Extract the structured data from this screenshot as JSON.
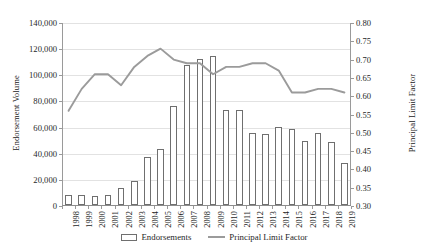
{
  "chart_data": {
    "type": "bar",
    "title": "",
    "subtitle": "",
    "xlabel": "",
    "ylabel": "Endorsement Volume",
    "y2label": "Principal Limit Factor",
    "grid": true,
    "legend_position": "bottom",
    "categories": [
      "1998",
      "1999",
      "2000",
      "2001",
      "2002",
      "2003",
      "2004",
      "2005",
      "2006",
      "2007",
      "2008",
      "2009",
      "2010",
      "2011",
      "2012",
      "2013",
      "2014",
      "2015",
      "2016",
      "2017",
      "2018",
      "2019"
    ],
    "ylim": [
      0,
      140000
    ],
    "ytick_labels": [
      "0",
      "20,000",
      "40,000",
      "60,000",
      "80,000",
      "100,000",
      "120,000",
      "140,000"
    ],
    "ytick_values": [
      0,
      20000,
      40000,
      60000,
      80000,
      100000,
      120000,
      140000
    ],
    "y2lim": [
      0.3,
      0.8
    ],
    "y2tick_labels": [
      "0.30",
      "0.35",
      "0.40",
      "0.45",
      "0.50",
      "0.55",
      "0.60",
      "0.65",
      "0.70",
      "0.75",
      "0.80"
    ],
    "y2tick_values": [
      0.3,
      0.35,
      0.4,
      0.45,
      0.5,
      0.55,
      0.6,
      0.65,
      0.7,
      0.75,
      0.8
    ],
    "series": [
      {
        "name": "Endorsements",
        "type": "bar",
        "axis": "left",
        "color": "#6f6f6f",
        "fill": "#ffffff",
        "values": [
          8000,
          8000,
          7000,
          7500,
          13000,
          18000,
          37000,
          43000,
          76000,
          107000,
          112000,
          114000,
          73000,
          73000,
          55000,
          54000,
          60000,
          58000,
          49000,
          55000,
          48000,
          32000
        ]
      },
      {
        "name": "Principal Limit Factor",
        "type": "line",
        "axis": "right",
        "color": "#9b9b9b",
        "values": [
          0.56,
          0.62,
          0.66,
          0.66,
          0.63,
          0.68,
          0.71,
          0.73,
          0.7,
          0.69,
          0.69,
          0.66,
          0.68,
          0.68,
          0.69,
          0.69,
          0.67,
          0.61,
          0.61,
          0.62,
          0.62,
          0.61
        ]
      }
    ]
  },
  "legend": {
    "items": [
      {
        "label": "Endorsements",
        "marker": "bar-swatch"
      },
      {
        "label": "Principal Limit Factor",
        "marker": "line-swatch"
      }
    ]
  }
}
